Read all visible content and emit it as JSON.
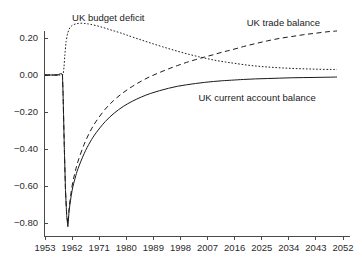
{
  "chart_data": {
    "type": "line",
    "title": "",
    "subtitle": "",
    "xlabel": "",
    "ylabel": "",
    "xlim": [
      1953,
      2052
    ],
    "ylim": [
      -0.85,
      0.3
    ],
    "grid": false,
    "legend_position": "inline-annotations",
    "x_tick_labels": [
      "1953",
      "1962",
      "1971",
      "1980",
      "1989",
      "1998",
      "2007",
      "2016",
      "2025",
      "2034",
      "2043",
      "2052"
    ],
    "x_ticks": [
      1953,
      1962,
      1971,
      1980,
      1989,
      1998,
      2007,
      2016,
      2025,
      2034,
      2043,
      2052
    ],
    "y_tick_labels": [
      "0.20",
      "0.00",
      "−0.20",
      "−0.40",
      "−0.60",
      "−0.80"
    ],
    "y_ticks": [
      0.2,
      0.0,
      -0.2,
      -0.4,
      -0.6,
      -0.8
    ],
    "annotations": [
      {
        "text": "UK budget deficit",
        "x": 1962,
        "y": 0.29
      },
      {
        "text": "UK trade balance",
        "x": 2020,
        "y": 0.265
      },
      {
        "text": "UK current account balance",
        "x": 2004,
        "y": -0.14
      }
    ],
    "series": [
      {
        "name": "UK budget deficit",
        "style": "dotted",
        "x": [
          1953,
          1954,
          1955,
          1956,
          1957,
          1958,
          1959,
          1959.3,
          1959.6,
          1960,
          1960.5,
          1961,
          1962,
          1963,
          1964,
          1965,
          1966,
          1967,
          1968,
          1970,
          1972,
          1974,
          1976,
          1978,
          1980,
          1983,
          1986,
          1989,
          1992,
          1995,
          1998,
          2001,
          2004,
          2007,
          2010,
          2013,
          2016,
          2020,
          2024,
          2028,
          2032,
          2036,
          2040,
          2044,
          2048,
          2050
        ],
        "y": [
          0.0,
          0.0,
          0.0,
          0.0,
          0.0,
          0.0,
          0.0,
          0.04,
          0.11,
          0.18,
          0.225,
          0.248,
          0.268,
          0.275,
          0.279,
          0.28,
          0.279,
          0.277,
          0.274,
          0.267,
          0.258,
          0.248,
          0.238,
          0.228,
          0.217,
          0.2,
          0.184,
          0.168,
          0.153,
          0.138,
          0.124,
          0.111,
          0.099,
          0.088,
          0.078,
          0.07,
          0.063,
          0.054,
          0.047,
          0.042,
          0.038,
          0.035,
          0.033,
          0.031,
          0.03,
          0.03
        ]
      },
      {
        "name": "UK trade balance",
        "style": "dashed",
        "x": [
          1953,
          1955,
          1957,
          1958.8,
          1959.0,
          1959.4,
          1959.8,
          1960.2,
          1960.6,
          1961,
          1962,
          1963,
          1964,
          1966,
          1968,
          1970,
          1973,
          1976,
          1979,
          1982,
          1985,
          1988,
          1991,
          1994,
          1997,
          2000,
          2003,
          2006,
          2009,
          2012,
          2015,
          2019,
          2023,
          2027,
          2031,
          2035,
          2039,
          2043,
          2047,
          2050
        ],
        "y": [
          0.0,
          0.0,
          0.0,
          0.0,
          -0.1,
          -0.38,
          -0.62,
          -0.755,
          -0.805,
          -0.72,
          -0.6,
          -0.525,
          -0.465,
          -0.375,
          -0.305,
          -0.25,
          -0.185,
          -0.135,
          -0.095,
          -0.062,
          -0.033,
          -0.008,
          0.013,
          0.033,
          0.051,
          0.068,
          0.083,
          0.097,
          0.11,
          0.124,
          0.136,
          0.154,
          0.17,
          0.185,
          0.198,
          0.208,
          0.218,
          0.226,
          0.234,
          0.238
        ]
      },
      {
        "name": "UK current account balance",
        "style": "solid",
        "x": [
          1953,
          1955,
          1957,
          1958.8,
          1959.0,
          1959.4,
          1959.8,
          1960.2,
          1960.6,
          1961,
          1962,
          1963,
          1964,
          1966,
          1968,
          1970,
          1973,
          1976,
          1979,
          1982,
          1985,
          1988,
          1991,
          1994,
          1997,
          2000,
          2003,
          2006,
          2009,
          2012,
          2015,
          2019,
          2023,
          2027,
          2031,
          2035,
          2039,
          2043,
          2047,
          2050
        ],
        "y": [
          0.0,
          0.0,
          0.0,
          0.0,
          -0.1,
          -0.38,
          -0.62,
          -0.76,
          -0.82,
          -0.735,
          -0.625,
          -0.558,
          -0.505,
          -0.425,
          -0.362,
          -0.312,
          -0.252,
          -0.206,
          -0.17,
          -0.142,
          -0.119,
          -0.1,
          -0.085,
          -0.072,
          -0.061,
          -0.053,
          -0.046,
          -0.04,
          -0.035,
          -0.031,
          -0.028,
          -0.024,
          -0.021,
          -0.019,
          -0.017,
          -0.015,
          -0.014,
          -0.013,
          -0.012,
          -0.011
        ]
      }
    ]
  }
}
